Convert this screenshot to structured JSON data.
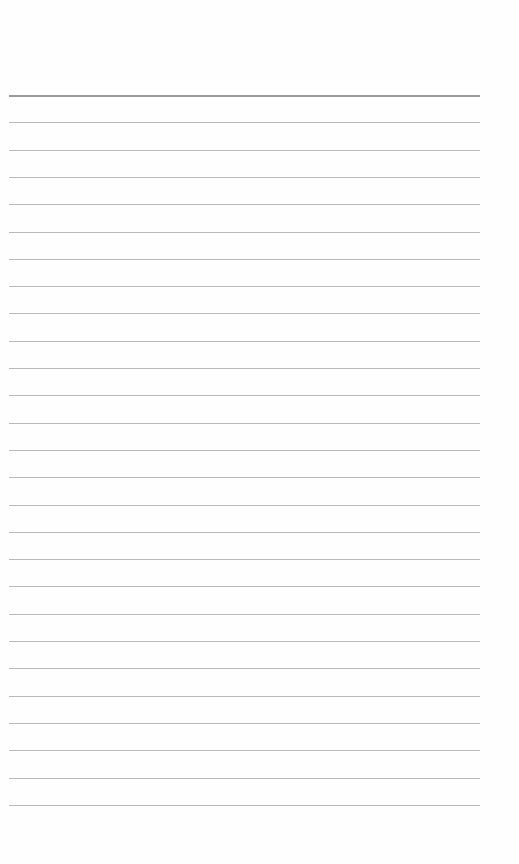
{
  "document": {
    "type": "lined-paper",
    "background_color": "#fefefe",
    "rule_color": "#b9b9b9",
    "header_rule_color": "#9a9a9a",
    "rules": {
      "count": 27,
      "first_y": 95,
      "spacing": 27.3,
      "left_x": 9,
      "right_x": 480
    },
    "text_lines": []
  }
}
